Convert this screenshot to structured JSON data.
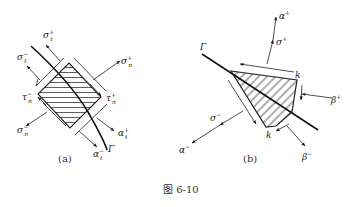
{
  "figure": {
    "caption": "图 6-10",
    "panel_a": {
      "label": "(a)",
      "curve_label": "Γ",
      "labels": {
        "sigma_t_plus": {
          "base": "σ",
          "sub": "t",
          "sup": "+"
        },
        "sigma_t_minus": {
          "base": "σ",
          "sub": "t",
          "sup": "−"
        },
        "sigma_n_plus": {
          "base": "σ",
          "sub": "n",
          "sup": "+"
        },
        "sigma_n_minus": {
          "base": "σ",
          "sub": "n",
          "sup": "−"
        },
        "tau_n_minus": {
          "base": "τ",
          "sub": "n",
          "sup": "−"
        },
        "tau_n_plus": {
          "base": "τ",
          "sub": "n",
          "sup": "+"
        },
        "alpha_t_plus": {
          "base": "α",
          "sub": "t",
          "sup": "+"
        },
        "alpha_t_minus": {
          "base": "α",
          "sub": "t",
          "sup": "−"
        }
      }
    },
    "panel_b": {
      "label": "(b)",
      "curve_label": "Γ",
      "labels": {
        "alpha_plus": {
          "base": "α",
          "sup": "+"
        },
        "sigma_plus": {
          "base": "σ",
          "sup": "+"
        },
        "sigma_minus": {
          "base": "σ",
          "sup": "−"
        },
        "alpha_minus": {
          "base": "α",
          "sup": "−"
        },
        "beta_plus": {
          "base": "β",
          "sup": "+"
        },
        "beta_minus": {
          "base": "β",
          "sup": "−"
        },
        "k_top": "k",
        "k_bottom": "k"
      }
    }
  }
}
